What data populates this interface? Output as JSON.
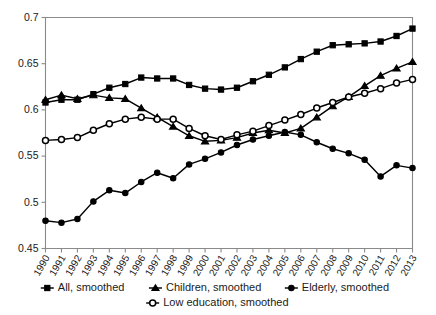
{
  "chart_data": {
    "type": "line",
    "title": "",
    "subtitle": "",
    "xlabel": "",
    "ylabel": "",
    "xlim": [
      1990,
      2013
    ],
    "ylim": [
      0.45,
      0.7
    ],
    "ytick_values": [
      0.45,
      0.5,
      0.55,
      0.6,
      0.65,
      0.7
    ],
    "ytick_labels": [
      "0.45",
      "0.5",
      "0.55",
      "0.6",
      "0.65",
      "0.7"
    ],
    "grid": false,
    "legend_position": "bottom",
    "categories": [
      1990,
      1991,
      1992,
      1993,
      1994,
      1995,
      1996,
      1997,
      1998,
      1999,
      2000,
      2001,
      2002,
      2003,
      2004,
      2005,
      2006,
      2007,
      2008,
      2009,
      2010,
      2011,
      2012,
      2013
    ],
    "xtick_labels": [
      "1990",
      "1991",
      "1992",
      "1993",
      "1994",
      "1995",
      "1996",
      "1997",
      "1998",
      "1999",
      "2000",
      "2001",
      "2002",
      "2003",
      "2004",
      "2005",
      "2006",
      "2007",
      "2008",
      "2009",
      "2010",
      "2011",
      "2012",
      "2013"
    ],
    "series": [
      {
        "name": "All, smoothed",
        "marker": "filled-square",
        "color": "#000000",
        "values": [
          0.608,
          0.611,
          0.611,
          0.617,
          0.624,
          0.628,
          0.635,
          0.634,
          0.634,
          0.627,
          0.623,
          0.622,
          0.624,
          0.631,
          0.638,
          0.646,
          0.655,
          0.663,
          0.67,
          0.671,
          0.672,
          0.674,
          0.68,
          0.688
        ]
      },
      {
        "name": "Children, smoothed",
        "marker": "filled-triangle",
        "color": "#000000",
        "values": [
          0.611,
          0.616,
          0.612,
          0.616,
          0.613,
          0.612,
          0.602,
          0.592,
          0.582,
          0.572,
          0.566,
          0.567,
          0.57,
          0.575,
          0.578,
          0.575,
          0.58,
          0.592,
          0.604,
          0.614,
          0.626,
          0.637,
          0.645,
          0.652
        ]
      },
      {
        "name": "Elderly, smoothed",
        "marker": "filled-circle",
        "color": "#000000",
        "values": [
          0.48,
          0.478,
          0.482,
          0.501,
          0.513,
          0.51,
          0.522,
          0.532,
          0.526,
          0.541,
          0.547,
          0.554,
          0.562,
          0.568,
          0.572,
          0.576,
          0.573,
          0.565,
          0.558,
          0.553,
          0.546,
          0.528,
          0.54,
          0.537
        ]
      },
      {
        "name": "Low education, smoothed",
        "marker": "open-circle",
        "color": "#000000",
        "values": [
          0.567,
          0.568,
          0.57,
          0.578,
          0.585,
          0.59,
          0.592,
          0.59,
          0.59,
          0.58,
          0.572,
          0.568,
          0.573,
          0.577,
          0.583,
          0.589,
          0.595,
          0.602,
          0.608,
          0.614,
          0.618,
          0.623,
          0.629,
          0.633
        ]
      }
    ]
  },
  "legend": {
    "entries": [
      {
        "label": "All, smoothed",
        "marker": "filled-square"
      },
      {
        "label": "Children, smoothed",
        "marker": "filled-triangle"
      },
      {
        "label": "Elderly, smoothed",
        "marker": "filled-circle"
      },
      {
        "label": "Low education, smoothed",
        "marker": "open-circle"
      }
    ]
  }
}
